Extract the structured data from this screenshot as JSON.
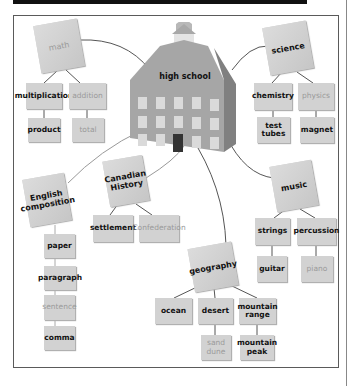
{
  "center": {
    "label": "high school",
    "icon": "school-building-icon"
  },
  "colors": {
    "box": "#d2d2d2",
    "line": "#555555",
    "dim_text": "#9a9a9a",
    "frame": "#5a5a5a"
  },
  "subjects": {
    "math": {
      "label": "math",
      "children": [
        {
          "label": "multiplication",
          "child": "product"
        },
        {
          "label": "addition",
          "child": "total"
        }
      ]
    },
    "science": {
      "label": "science",
      "children": [
        {
          "label": "chemistry",
          "child": "test tubes"
        },
        {
          "label": "physics",
          "child": "magnet"
        }
      ]
    },
    "english": {
      "label": "English composition",
      "chain": [
        "paper",
        "paragraph",
        "sentence",
        "comma"
      ]
    },
    "history": {
      "label": "Canadian History",
      "children": [
        "settlement",
        "Confederation"
      ]
    },
    "music": {
      "label": "music",
      "children": [
        {
          "label": "strings",
          "child": "guitar"
        },
        {
          "label": "percussion",
          "child": "piano"
        }
      ]
    },
    "geography": {
      "label": "geography",
      "children": [
        {
          "label": "ocean"
        },
        {
          "label": "desert",
          "child": "sand dune"
        },
        {
          "label": "mountain range",
          "child": "mountain peak"
        }
      ]
    }
  }
}
